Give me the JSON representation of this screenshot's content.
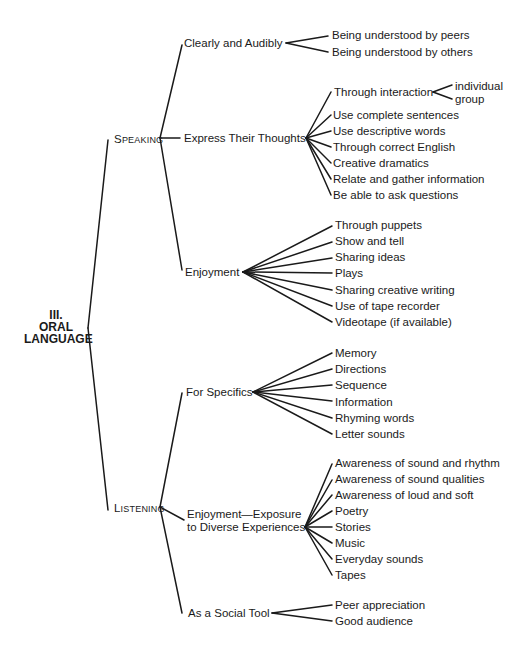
{
  "root": {
    "line1": "III.",
    "line2": "ORAL",
    "line3": "LANGUAGE"
  },
  "branches": [
    {
      "label_initial": "S",
      "label_rest": "PEAKING",
      "label": "Speaking",
      "children": [
        {
          "label": "Clearly and Audibly",
          "items": [
            "Being understood by peers",
            "Being understood by others"
          ]
        },
        {
          "label": "Express Their Thoughts",
          "items": [
            "Through interaction",
            "Use complete sentences",
            "Use descriptive words",
            "Through correct English",
            "Creative dramatics",
            "Relate and gather information",
            "Be able to ask questions"
          ],
          "sub": {
            "parent": "Through interaction",
            "items": [
              "individual",
              "group"
            ]
          }
        },
        {
          "label": "Enjoyment",
          "items": [
            "Through puppets",
            "Show and tell",
            "Sharing ideas",
            "Plays",
            "Sharing creative writing",
            "Use of tape recorder",
            "Videotape (if available)"
          ]
        }
      ]
    },
    {
      "label_initial": "L",
      "label_rest": "ISTENING",
      "label": "Listening",
      "children": [
        {
          "label": "For Specifics",
          "items": [
            "Memory",
            "Directions",
            "Sequence",
            "Information",
            "Rhyming words",
            "Letter sounds"
          ]
        },
        {
          "label_line1": "Enjoyment—Exposure",
          "label_line2": "to Diverse Experiences",
          "items": [
            "Awareness of sound and rhythm",
            "Awareness of sound qualities",
            "Awareness of loud and soft",
            "Poetry",
            "Stories",
            "Music",
            "Everyday sounds",
            "Tapes"
          ]
        },
        {
          "label": "As a Social Tool",
          "items": [
            "Peer appreciation",
            "Good audience"
          ]
        }
      ]
    }
  ],
  "colors": {
    "ink": "#1a1a1a",
    "background": "#ffffff"
  }
}
